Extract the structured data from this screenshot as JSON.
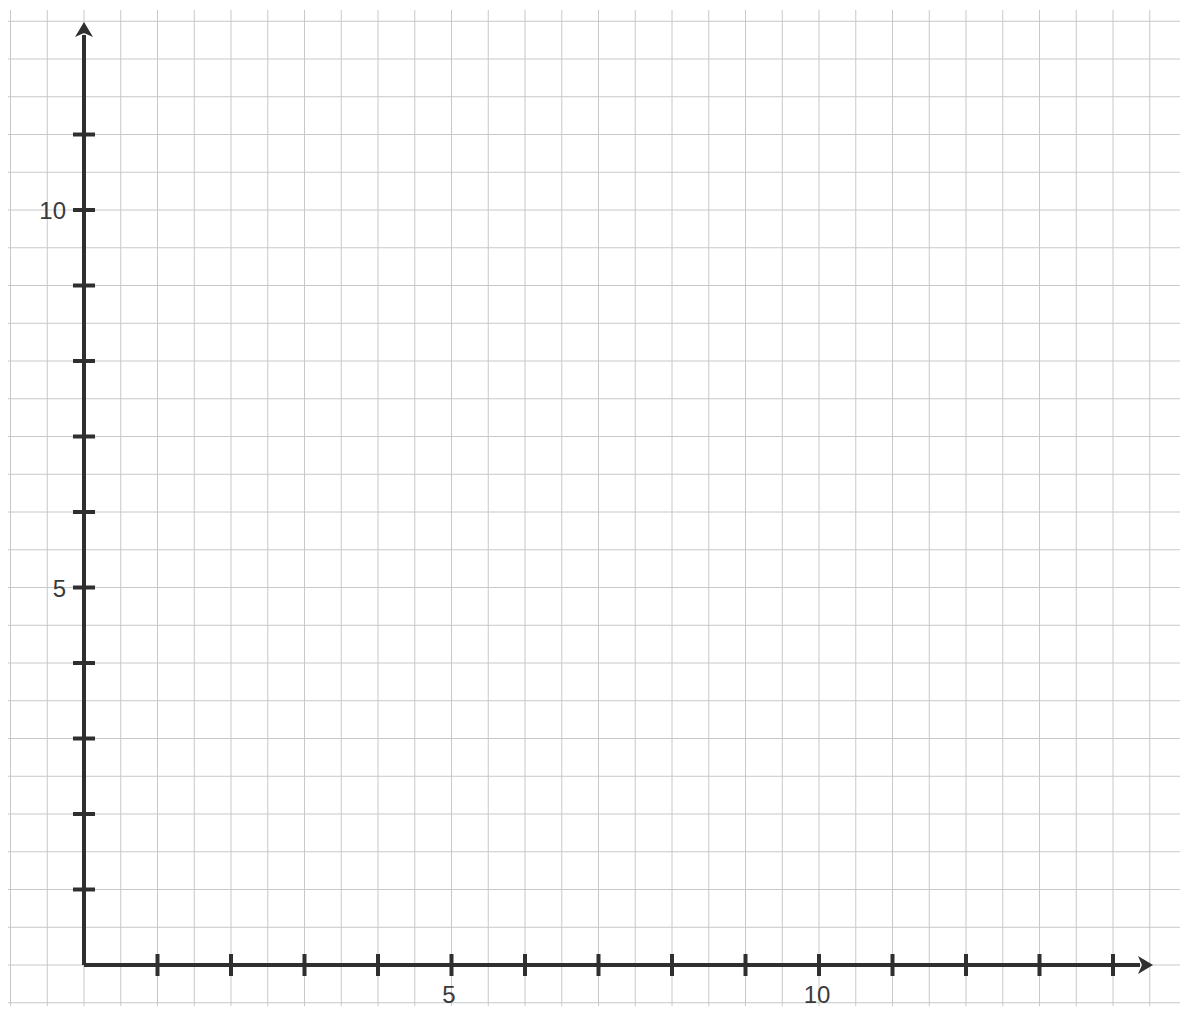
{
  "chart_data": {
    "type": "scatter",
    "title": "",
    "xlabel": "",
    "ylabel": "",
    "xlim": [
      0,
      14.5
    ],
    "ylim": [
      0,
      12.5
    ],
    "x_ticks": [
      1,
      2,
      3,
      4,
      5,
      6,
      7,
      8,
      9,
      10,
      11,
      12,
      13,
      14
    ],
    "y_ticks": [
      1,
      2,
      3,
      4,
      5,
      6,
      7,
      8,
      9,
      10,
      11
    ],
    "x_tick_labels": {
      "5": "5",
      "10": "10"
    },
    "y_tick_labels": {
      "5": "5",
      "10": "10"
    },
    "grid": true,
    "grid_step": 0.5,
    "series": [],
    "colors": {
      "axis": "#2f2f2f",
      "grid": "#c8c8c8",
      "label": "#3a3a3a"
    }
  },
  "labels": {
    "x5": "5",
    "x10": "10",
    "y5": "5",
    "y10": "10"
  }
}
